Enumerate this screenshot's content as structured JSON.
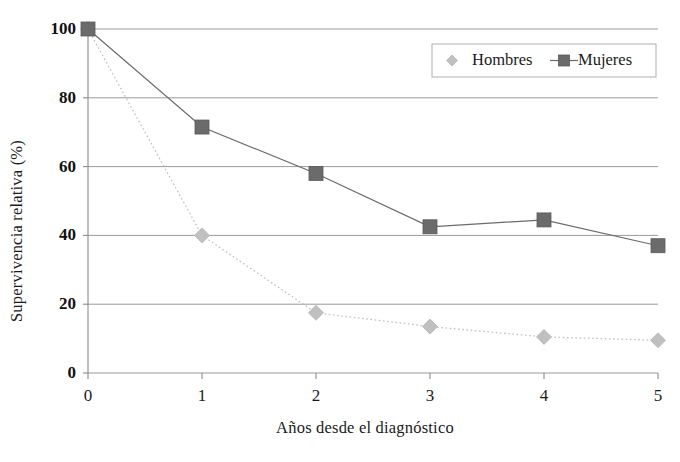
{
  "chart_data": {
    "type": "line",
    "title": "",
    "subtitle": "",
    "xlabel": "Años desde el diagnóstico",
    "ylabel": "Supervivencia relativa (%)",
    "x": [
      0,
      1,
      2,
      3,
      4,
      5
    ],
    "xtick_labels": [
      "0",
      "1",
      "2",
      "3",
      "4",
      "5"
    ],
    "ytick_labels": [
      "0",
      "20",
      "40",
      "60",
      "80",
      "100"
    ],
    "yticks": [
      0,
      20,
      40,
      60,
      80,
      100
    ],
    "xlim": [
      0,
      5
    ],
    "ylim": [
      0,
      100
    ],
    "grid": "horizontal",
    "legend_position": "top-right",
    "series": [
      {
        "name": "Hombres",
        "values": [
          100,
          40,
          17.5,
          13.5,
          10.5,
          9.5
        ],
        "color": "#c0c0c0",
        "marker": "diamond",
        "linestyle": "dotted"
      },
      {
        "name": "Mujeres",
        "values": [
          100,
          71.5,
          58,
          42.5,
          44.5,
          37
        ],
        "color": "#6b6b6b",
        "marker": "square",
        "linestyle": "solid"
      }
    ]
  },
  "legend": {
    "items": [
      {
        "label": "Hombres"
      },
      {
        "label": "Mujeres"
      }
    ]
  },
  "axes": {
    "y_title": "Supervivencia relativa (%)",
    "x_title": "Años desde el diagnóstico"
  },
  "colors": {
    "hombres": "#c0c0c0",
    "mujeres": "#6b6b6b",
    "grid": "#9a9a9a",
    "axis": "#8a8a8a",
    "text": "#1a1a1a"
  }
}
